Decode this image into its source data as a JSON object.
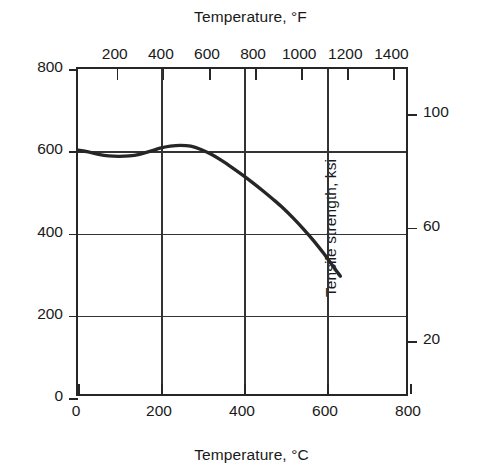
{
  "chart_data": {
    "type": "line",
    "title": "",
    "xlabel": "Temperature, °C",
    "ylabel": "Tensile strength, MPa",
    "xlabel_secondary": "Temperature, °F",
    "ylabel_secondary": "Tensile strength, ksi",
    "xlim": [
      0,
      800
    ],
    "ylim": [
      0,
      800
    ],
    "xlim_secondary": [
      32,
      1472
    ],
    "ylim_secondary": [
      0,
      116
    ],
    "grid": true,
    "legend": null,
    "xticks_bottom": [
      {
        "value": 0,
        "label": "0"
      },
      {
        "value": 200,
        "label": "200"
      },
      {
        "value": 400,
        "label": "400"
      },
      {
        "value": 600,
        "label": "600"
      },
      {
        "value": 800,
        "label": "800"
      }
    ],
    "xticks_top": [
      {
        "value": 200,
        "label": "200"
      },
      {
        "value": 400,
        "label": "400"
      },
      {
        "value": 600,
        "label": "600"
      },
      {
        "value": 800,
        "label": "800"
      },
      {
        "value": 1000,
        "label": "1000"
      },
      {
        "value": 1200,
        "label": "1200"
      },
      {
        "value": 1400,
        "label": "1400"
      }
    ],
    "yticks_left": [
      {
        "value": 0,
        "label": "0"
      },
      {
        "value": 200,
        "label": "200"
      },
      {
        "value": 400,
        "label": "400"
      },
      {
        "value": 600,
        "label": "600"
      },
      {
        "value": 800,
        "label": "800"
      }
    ],
    "yticks_right": [
      {
        "value": 20,
        "label": "20"
      },
      {
        "value": 60,
        "label": "60"
      },
      {
        "value": 100,
        "label": "100"
      }
    ],
    "gridlines_x": [
      200,
      400,
      600
    ],
    "gridlines_y": [
      200,
      400,
      600
    ],
    "series": [
      {
        "name": "Tensile strength",
        "color": "#262626",
        "x": [
          0,
          25,
          50,
          75,
          100,
          125,
          150,
          175,
          200,
          225,
          250,
          275,
          300,
          325,
          350,
          375,
          400,
          425,
          450,
          475,
          500,
          525,
          550,
          575,
          600,
          620,
          640
        ],
        "values": [
          600,
          596,
          590,
          586,
          585,
          586,
          590,
          597,
          605,
          610,
          612,
          610,
          602,
          590,
          575,
          558,
          540,
          521,
          501,
          480,
          458,
          433,
          406,
          377,
          345,
          317,
          290
        ]
      }
    ]
  },
  "colors": {
    "axis": "#262626",
    "grid": "#333333",
    "curve": "#262626",
    "background": "#ffffff",
    "text": "#1a1a1a"
  }
}
